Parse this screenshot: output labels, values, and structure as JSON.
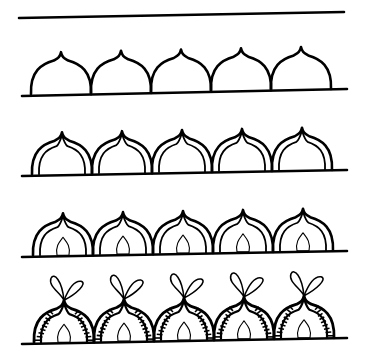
{
  "colors": {
    "ink": "#000000",
    "paper": "#ffffff"
  },
  "top_line": {
    "x1": 19,
    "y1": 18,
    "x2": 344,
    "y2": 12
  },
  "dome": {
    "width": 60,
    "height": 42,
    "count": 5
  },
  "rows": [
    {
      "step": 1,
      "name": "outline-domes",
      "baseline": {
        "x1": 22,
        "y1": 96,
        "x2": 347,
        "y2": 89
      },
      "start_x": 31,
      "inner_arc": false,
      "teardrop": false,
      "hatching": false,
      "loops": false
    },
    {
      "step": 2,
      "name": "add-inner-arc",
      "baseline": {
        "x1": 22,
        "y1": 176,
        "x2": 347,
        "y2": 170
      },
      "start_x": 32,
      "inner_arc": true,
      "teardrop": false,
      "hatching": false,
      "loops": false
    },
    {
      "step": 3,
      "name": "add-teardrop",
      "baseline": {
        "x1": 22,
        "y1": 257,
        "x2": 347,
        "y2": 251
      },
      "start_x": 33,
      "inner_arc": true,
      "teardrop": true,
      "hatching": false,
      "loops": false
    },
    {
      "step": 4,
      "name": "add-hatching-and-loops",
      "baseline": {
        "x1": 22,
        "y1": 344,
        "x2": 347,
        "y2": 338
      },
      "start_x": 34,
      "inner_arc": true,
      "teardrop": true,
      "hatching": true,
      "loops": true
    }
  ]
}
